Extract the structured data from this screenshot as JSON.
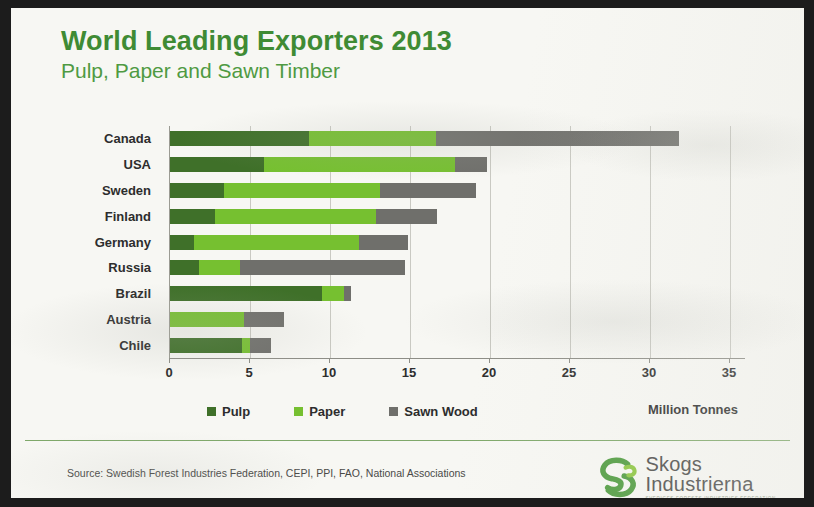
{
  "slide": {
    "title": "World Leading Exporters 2013",
    "subtitle": "Pulp, Paper and Sawn Timber",
    "source": "Source: Swedish Forest Industries  Federation, CEPI, PPI, FAO, National Associations",
    "logo": {
      "line1": "Skogs",
      "line2": "Industrierna",
      "tagline": "SVERIGES FORESTS INDUSTRIES FEDERATION"
    }
  },
  "colors": {
    "title_green": "#3f8b34",
    "subtitle_green": "#4f9a42",
    "pulp": "#3f7029",
    "paper": "#76c030",
    "sawn_wood": "#6f6f6b",
    "divider": "#7fa86a",
    "slide_bg": "#f7f7f3"
  },
  "chart_data": {
    "type": "bar",
    "orientation": "horizontal",
    "stacked": true,
    "title": "World Leading Exporters 2013",
    "subtitle": "Pulp, Paper and Sawn Timber",
    "xlabel": "Million Tonnes",
    "ylabel": "",
    "xlim": [
      0,
      36
    ],
    "xticks": [
      0,
      5,
      10,
      15,
      20,
      25,
      30,
      35
    ],
    "xtick_labels": [
      "0",
      "5",
      "10",
      "15",
      "20",
      "25",
      "30",
      "35"
    ],
    "grid": true,
    "legend_position": "bottom",
    "categories": [
      "Canada",
      "USA",
      "Sweden",
      "Finland",
      "Germany",
      "Russia",
      "Brazil",
      "Austria",
      "Chile"
    ],
    "series": [
      {
        "name": "Pulp",
        "color": "#3f7029",
        "values": [
          8.7,
          5.9,
          3.4,
          2.8,
          1.5,
          1.8,
          9.5,
          0.0,
          4.5
        ]
      },
      {
        "name": "Paper",
        "color": "#76c030",
        "values": [
          7.9,
          11.9,
          9.7,
          10.1,
          10.3,
          2.6,
          1.4,
          4.6,
          0.5
        ]
      },
      {
        "name": "Sawn Wood",
        "color": "#6f6f6b",
        "values": [
          15.2,
          2.0,
          6.0,
          3.8,
          3.1,
          10.3,
          0.4,
          2.5,
          1.3
        ]
      }
    ],
    "totals": [
      31.8,
      19.8,
      19.1,
      16.7,
      14.9,
      14.7,
      11.3,
      7.1,
      6.3
    ]
  }
}
